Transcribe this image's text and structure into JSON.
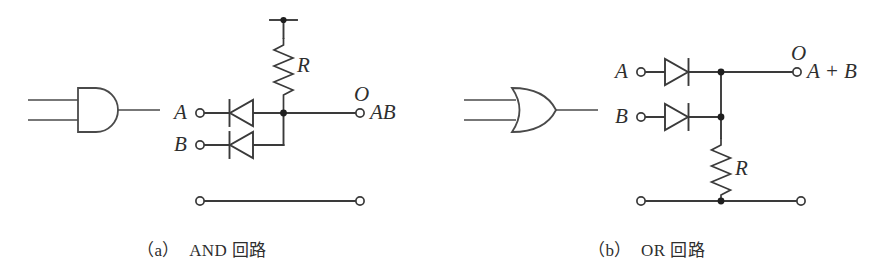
{
  "figure": {
    "type": "diode-logic-circuit-diagram",
    "background_color": "#ffffff",
    "line_color": "#3a3a3a",
    "node_color": "#1f1f1f"
  },
  "panels": [
    {
      "id": "panel-a",
      "caption": "（a）　AND 回路",
      "caption_index": "（a）",
      "caption_text": "AND 回路",
      "gate": {
        "name": "and-gate-symbol",
        "shape": "and",
        "input_count": 2,
        "output_count": 1
      },
      "labels": {
        "input_a": "A",
        "input_b": "B",
        "output_terminal": "O",
        "output_expression": "AB",
        "resistor": "R"
      },
      "components": {
        "resistor_label": "R",
        "resistor_orientation": "vertical-top",
        "diode_direction": "left",
        "diode_count": 2,
        "supply_terminal": "top-rail",
        "ground_rail_terminals": 2,
        "junction_dots": 2
      }
    },
    {
      "id": "panel-b",
      "caption": "（b）　OR 回路",
      "caption_index": "（b）",
      "caption_text": "OR 回路",
      "gate": {
        "name": "or-gate-symbol",
        "shape": "or",
        "input_count": 2,
        "output_count": 1
      },
      "labels": {
        "input_a": "A",
        "input_b": "B",
        "output_terminal": "O",
        "output_expression": "A + B",
        "resistor": "R"
      },
      "components": {
        "resistor_label": "R",
        "resistor_orientation": "vertical-bottom",
        "diode_direction": "right",
        "diode_count": 2,
        "ground_rail_terminals": 2,
        "junction_dots": 3
      }
    }
  ]
}
